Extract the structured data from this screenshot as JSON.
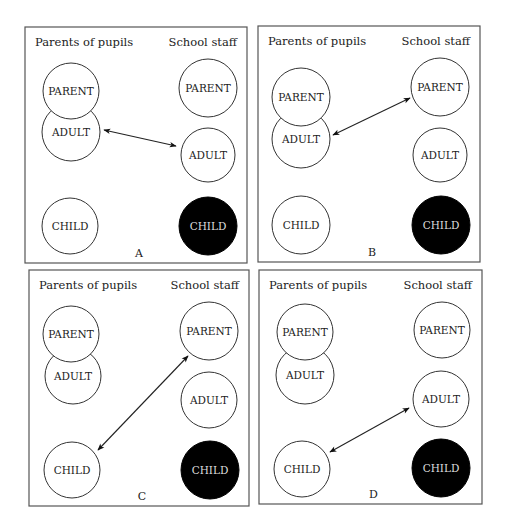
{
  "figure": {
    "headers": {
      "left": "Parents of pupils",
      "right": "School staff"
    },
    "node_labels": {
      "parent": "PARENT",
      "adult": "ADULT",
      "child": "CHILD"
    },
    "colors": {
      "frame": "#555555",
      "outline": "#333333",
      "filled": "#000000",
      "filled_text": "#dddddd",
      "text": "#222222"
    },
    "panels": [
      {
        "letter": "A",
        "frame": {
          "x": 25,
          "y": 27,
          "w": 222,
          "h": 236
        },
        "left_nodes": [
          {
            "id": "parent",
            "label": "PARENT",
            "cx": 71,
            "cy": 91,
            "r": 28,
            "filled": false
          },
          {
            "id": "adult",
            "label": "ADULT",
            "cx": 71,
            "cy": 132,
            "r": 29,
            "filled": false
          },
          {
            "id": "child",
            "label": "CHILD",
            "cx": 70,
            "cy": 226,
            "r": 28,
            "filled": false
          }
        ],
        "right_nodes": [
          {
            "id": "parent",
            "label": "PARENT",
            "cx": 208,
            "cy": 88,
            "r": 29,
            "filled": false
          },
          {
            "id": "adult",
            "label": "ADULT",
            "cx": 208,
            "cy": 155,
            "r": 27,
            "filled": false
          },
          {
            "id": "child",
            "label": "CHILD",
            "cx": 208,
            "cy": 226,
            "r": 29,
            "filled": true
          }
        ],
        "arrow": {
          "from": "Parents of pupils ADULT",
          "to": "School staff ADULT",
          "x1": 104,
          "y1": 130,
          "x2": 176,
          "y2": 146
        }
      },
      {
        "letter": "B",
        "frame": {
          "x": 258,
          "y": 26,
          "w": 222,
          "h": 236
        },
        "left_nodes": [
          {
            "id": "parent",
            "label": "PARENT",
            "cx": 301,
            "cy": 97,
            "r": 29,
            "filled": false
          },
          {
            "id": "adult",
            "label": "ADULT",
            "cx": 301,
            "cy": 139,
            "r": 29,
            "filled": false
          },
          {
            "id": "child",
            "label": "CHILD",
            "cx": 301,
            "cy": 225,
            "r": 29,
            "filled": false
          }
        ],
        "right_nodes": [
          {
            "id": "parent",
            "label": "PARENT",
            "cx": 440,
            "cy": 87,
            "r": 29,
            "filled": false
          },
          {
            "id": "adult",
            "label": "ADULT",
            "cx": 440,
            "cy": 155,
            "r": 27,
            "filled": false
          },
          {
            "id": "child",
            "label": "CHILD",
            "cx": 441,
            "cy": 225,
            "r": 29,
            "filled": true
          }
        ],
        "arrow": {
          "from": "Parents of pupils ADULT",
          "to": "School staff PARENT",
          "x1": 333,
          "y1": 135,
          "x2": 410,
          "y2": 98
        }
      },
      {
        "letter": "C",
        "frame": {
          "x": 29,
          "y": 270,
          "w": 220,
          "h": 236
        },
        "left_nodes": [
          {
            "id": "parent",
            "label": "PARENT",
            "cx": 71,
            "cy": 334,
            "r": 28,
            "filled": false
          },
          {
            "id": "adult",
            "label": "ADULT",
            "cx": 73,
            "cy": 376,
            "r": 28,
            "filled": false
          },
          {
            "id": "child",
            "label": "CHILD",
            "cx": 72,
            "cy": 470,
            "r": 28,
            "filled": false
          }
        ],
        "right_nodes": [
          {
            "id": "parent",
            "label": "PARENT",
            "cx": 209,
            "cy": 331,
            "r": 29,
            "filled": false
          },
          {
            "id": "adult",
            "label": "ADULT",
            "cx": 209,
            "cy": 400,
            "r": 28,
            "filled": false
          },
          {
            "id": "child",
            "label": "CHILD",
            "cx": 210,
            "cy": 470,
            "r": 29,
            "filled": true
          }
        ],
        "arrow": {
          "from": "Parents of pupils CHILD",
          "to": "School staff PARENT",
          "x1": 98,
          "y1": 450,
          "x2": 188,
          "y2": 356
        }
      },
      {
        "letter": "D",
        "frame": {
          "x": 259,
          "y": 270,
          "w": 223,
          "h": 234
        },
        "left_nodes": [
          {
            "id": "parent",
            "label": "PARENT",
            "cx": 305,
            "cy": 332,
            "r": 28,
            "filled": false
          },
          {
            "id": "adult",
            "label": "ADULT",
            "cx": 305,
            "cy": 375,
            "r": 29,
            "filled": false
          },
          {
            "id": "child",
            "label": "CHILD",
            "cx": 302,
            "cy": 469,
            "r": 28,
            "filled": false
          }
        ],
        "right_nodes": [
          {
            "id": "parent",
            "label": "PARENT",
            "cx": 442,
            "cy": 330,
            "r": 28,
            "filled": false
          },
          {
            "id": "adult",
            "label": "ADULT",
            "cx": 441,
            "cy": 399,
            "r": 28,
            "filled": false
          },
          {
            "id": "child",
            "label": "CHILD",
            "cx": 441,
            "cy": 468,
            "r": 29,
            "filled": true
          }
        ],
        "arrow": {
          "from": "Parents of pupils CHILD",
          "to": "School staff ADULT",
          "x1": 330,
          "y1": 452,
          "x2": 409,
          "y2": 408
        }
      }
    ]
  }
}
